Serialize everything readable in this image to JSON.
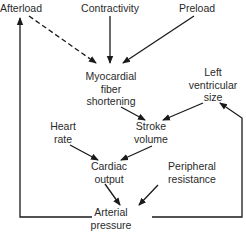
{
  "diagram": {
    "nodes": [
      {
        "id": "afterload",
        "lines": [
          "Afterload"
        ],
        "x": 21,
        "y": 2
      },
      {
        "id": "contractivity",
        "lines": [
          "Contractivity"
        ],
        "x": 110,
        "y": 2
      },
      {
        "id": "preload",
        "lines": [
          "Preload"
        ],
        "x": 197,
        "y": 2
      },
      {
        "id": "myocardial",
        "lines": [
          "Myocardial",
          "fiber",
          "shortening"
        ],
        "x": 111,
        "y": 71
      },
      {
        "id": "lv-size",
        "lines": [
          "Left",
          "ventricular",
          "size"
        ],
        "x": 213,
        "y": 67
      },
      {
        "id": "heart-rate",
        "lines": [
          "Heart",
          "rate"
        ],
        "x": 63,
        "y": 121
      },
      {
        "id": "stroke-volume",
        "lines": [
          "Stroke",
          "volume"
        ],
        "x": 151,
        "y": 121
      },
      {
        "id": "cardiac-output",
        "lines": [
          "Cardiac",
          "output"
        ],
        "x": 109,
        "y": 160
      },
      {
        "id": "peripheral",
        "lines": [
          "Peripheral",
          "resistance"
        ],
        "x": 192,
        "y": 160
      },
      {
        "id": "arterial",
        "lines": [
          "Arterial",
          "pressure"
        ],
        "x": 111,
        "y": 206
      }
    ],
    "edges": [
      {
        "from": "afterload",
        "to": "myocardial",
        "style": "dashed"
      },
      {
        "from": "contractivity",
        "to": "myocardial",
        "style": "solid"
      },
      {
        "from": "preload",
        "to": "myocardial",
        "style": "solid"
      },
      {
        "from": "myocardial",
        "to": "stroke-volume",
        "style": "solid"
      },
      {
        "from": "lv-size",
        "to": "stroke-volume",
        "style": "solid"
      },
      {
        "from": "heart-rate",
        "to": "cardiac-output",
        "style": "solid"
      },
      {
        "from": "stroke-volume",
        "to": "cardiac-output",
        "style": "solid"
      },
      {
        "from": "cardiac-output",
        "to": "arterial",
        "style": "solid"
      },
      {
        "from": "peripheral",
        "to": "arterial",
        "style": "solid"
      },
      {
        "from": "arterial",
        "to": "afterload",
        "style": "solid",
        "route": "left-loop"
      },
      {
        "from": "arterial",
        "to": "lv-size",
        "style": "solid",
        "route": "right-loop"
      }
    ],
    "colors": {
      "line": "#1a1a1a",
      "text": "#2a2a2a",
      "background": "#ffffff"
    }
  }
}
